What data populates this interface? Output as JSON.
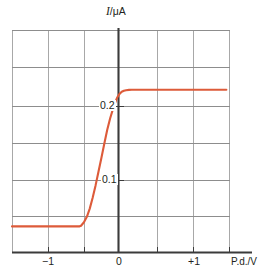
{
  "figure": {
    "name": "photoelectric-current-vs-pd-graph",
    "background_color": "#ffffff",
    "curve_color": "#dd5b3a",
    "axis_color": "#3b3b3b",
    "grid_color": "#a8a8a8",
    "text_color": "#231f20"
  },
  "axes": {
    "y_axis_title": "I/μA",
    "y_axis_title_symbol": "I",
    "y_axis_title_rest": "/μA",
    "x_axis_title": "P.d./V",
    "x_ticks": [
      {
        "label": "−1",
        "value": -1
      },
      {
        "label": "0",
        "value": 0
      },
      {
        "label": "+1",
        "value": 1
      }
    ],
    "y_ticks": [
      {
        "label": "0.1",
        "value": 0.1
      },
      {
        "label": "0.2",
        "value": 0.2
      }
    ]
  },
  "chart_data": {
    "type": "line",
    "title": "",
    "subtitle": "",
    "xlabel": "P.d./V",
    "ylabel": "I/μA",
    "xlim": [
      -1.45,
      1.55
    ],
    "ylim": [
      -0.0375,
      0.2875
    ],
    "grid": true,
    "legend_position": "none",
    "x_tick_labels": [
      "−1",
      "0",
      "+1"
    ],
    "x_tick_values": [
      -1,
      0,
      1
    ],
    "y_tick_labels": [
      "0.1",
      "0.2"
    ],
    "y_tick_values": [
      0.1,
      0.2
    ],
    "x_grid_values": [
      -1.45,
      -0.95,
      -0.45,
      0.0,
      0.5,
      1.0,
      1.5
    ],
    "y_grid_values": [
      0.0,
      0.05,
      0.1,
      0.15,
      0.2,
      0.25,
      0.2875
    ],
    "saturation_current": 0.2,
    "stopping_potential": -0.5,
    "annotations": [],
    "series": [
      {
        "name": "photoelectric current",
        "color": "#dd5b3a",
        "x": [
          -1.45,
          -1.2,
          -1.0,
          -0.8,
          -0.6,
          -0.52,
          -0.5,
          -0.46,
          -0.42,
          -0.38,
          -0.34,
          -0.3,
          -0.26,
          -0.22,
          -0.18,
          -0.14,
          -0.1,
          -0.06,
          -0.02,
          0.0,
          0.03,
          0.06,
          0.09,
          0.12,
          0.16,
          0.2,
          0.3,
          0.5,
          0.75,
          1.0,
          1.25,
          1.5
        ],
        "y": [
          0.0,
          0.0,
          0.0,
          0.0,
          0.0,
          0.0,
          0.001,
          0.006,
          0.014,
          0.026,
          0.042,
          0.06,
          0.08,
          0.1,
          0.121,
          0.141,
          0.158,
          0.172,
          0.184,
          0.189,
          0.194,
          0.197,
          0.1985,
          0.1993,
          0.1998,
          0.2,
          0.2,
          0.2,
          0.2,
          0.2,
          0.2,
          0.2
        ]
      }
    ]
  }
}
